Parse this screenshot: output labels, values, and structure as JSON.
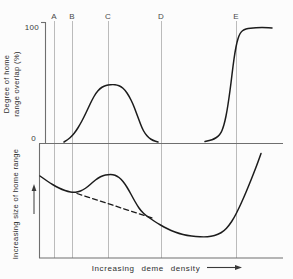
{
  "figure": {
    "background": "#fcfcfc",
    "colors": {
      "curve": "#1c1c1c",
      "axis": "#6f6f6f",
      "gridline": "#b3b3b3",
      "label": "#3a3a3a"
    },
    "top_panel": {
      "ylabel_line1": "Degree of home",
      "ylabel_line2": "range overlap (%)",
      "ytick_top": "100",
      "ytick_bottom": "0"
    },
    "bottom_panel": {
      "ylabel": "Increasing size of home range"
    },
    "xlabel": "Increasing  deme  density"
  },
  "chart_data": {
    "type": "line",
    "xlabel": "Increasing deme density",
    "x_markers": {
      "labels": [
        "A",
        "B",
        "C",
        "D",
        "E"
      ],
      "x_px": [
        54,
        72,
        108,
        161,
        236
      ],
      "label_baseline_y": 19,
      "line_y1": 21,
      "line_y2": 258
    },
    "panels": [
      {
        "name": "top",
        "ylabel": "Degree of home range overlap (%)",
        "ylim": [
          0,
          100
        ],
        "yticks": [
          0,
          100
        ],
        "marker_values_pct": {
          "A": 0,
          "B": 0,
          "C": 50,
          "D": 0,
          "E": 100
        },
        "series": [
          {
            "name": "overlap_bell",
            "desc": "unimodal flat-topped curve between B and D peaking at ~50% around C",
            "style": "solid",
            "points": [
              [
                64,
                142
              ],
              [
                68,
                139.5
              ],
              [
                72,
                136
              ],
              [
                76,
                131
              ],
              [
                80,
                124.5
              ],
              [
                84,
                117
              ],
              [
                88,
                108.5
              ],
              [
                92,
                100
              ],
              [
                96,
                93
              ],
              [
                100,
                88.5
              ],
              [
                104,
                86
              ],
              [
                108,
                85
              ],
              [
                113,
                84.5
              ],
              [
                117,
                85
              ],
              [
                121,
                86.5
              ],
              [
                125,
                90
              ],
              [
                129,
                96
              ],
              [
                133,
                104
              ],
              [
                136,
                112
              ],
              [
                139,
                120
              ],
              [
                142,
                128
              ],
              [
                145,
                133.5
              ],
              [
                149,
                138
              ],
              [
                153,
                140.5
              ],
              [
                158,
                142
              ]
            ]
          },
          {
            "name": "overlap_sigmoid",
            "desc": "sigmoidal rise from 0 to ~100% centered just before E",
            "style": "solid",
            "points": [
              [
                205,
                141.5
              ],
              [
                210,
                140.5
              ],
              [
                214,
                139
              ],
              [
                218,
                136.5
              ],
              [
                221,
                133
              ],
              [
                223,
                128
              ],
              [
                225,
                121
              ],
              [
                227,
                111
              ],
              [
                229,
                98
              ],
              [
                231,
                83
              ],
              [
                233,
                66
              ],
              [
                235,
                52
              ],
              [
                237,
                42
              ],
              [
                239,
                35.5
              ],
              [
                241,
                32
              ],
              [
                244,
                29.5
              ],
              [
                248,
                28.5
              ],
              [
                253,
                28
              ],
              [
                259,
                27.5
              ],
              [
                265,
                27.5
              ],
              [
                272,
                28
              ]
            ]
          }
        ]
      },
      {
        "name": "bottom",
        "ylabel": "Increasing size of home range (arrow up)",
        "series": [
          {
            "name": "home_range_size",
            "desc": "declines from left, local bump peaking near C, broad minimum between D and E, steep rise after E",
            "style": "solid",
            "points": [
              [
                40,
                176
              ],
              [
                45,
                179.5
              ],
              [
                50,
                183
              ],
              [
                56,
                186.5
              ],
              [
                62,
                189.5
              ],
              [
                68,
                191.5
              ],
              [
                73,
                192.5
              ],
              [
                78,
                192
              ],
              [
                83,
                190
              ],
              [
                88,
                186.5
              ],
              [
                93,
                182
              ],
              [
                98,
                178
              ],
              [
                103,
                175.5
              ],
              [
                108,
                174.5
              ],
              [
                113,
                174.5
              ],
              [
                117,
                176
              ],
              [
                121,
                179
              ],
              [
                125,
                184
              ],
              [
                129,
                190.5
              ],
              [
                133,
                198
              ],
              [
                137,
                205
              ],
              [
                141,
                211
              ],
              [
                146,
                215.5
              ],
              [
                151,
                219
              ],
              [
                157,
                223
              ],
              [
                164,
                227
              ],
              [
                171,
                230.5
              ],
              [
                179,
                233.5
              ],
              [
                187,
                235.5
              ],
              [
                196,
                236.5
              ],
              [
                204,
                237
              ],
              [
                211,
                236.5
              ],
              [
                218,
                234.5
              ],
              [
                224,
                231
              ],
              [
                229,
                225.5
              ],
              [
                234,
                218
              ],
              [
                239,
                208
              ],
              [
                244,
                197
              ],
              [
                249,
                185
              ],
              [
                254,
                172.5
              ],
              [
                258,
                162
              ],
              [
                261,
                153.5
              ]
            ]
          },
          {
            "name": "extrapolated_trend",
            "desc": "dashed straight continuation of the initial decline, rejoining solid curve right of D",
            "style": "dashed",
            "points": [
              [
                77,
                193.5
              ],
              [
                152,
                218
              ]
            ]
          }
        ]
      }
    ],
    "layout": {
      "width": 293,
      "height": 279,
      "top_y_axis": {
        "x": 45.5,
        "y1": 22,
        "y2": 143,
        "tick_x1": 41,
        "tick_y": 22.5
      },
      "zero_line": {
        "x1": 39,
        "x2": 283,
        "y": 143.5
      },
      "bottom_y_axis": {
        "x": 39.5,
        "y1": 143.5,
        "y2": 258
      },
      "bottom_x_axis": {
        "x1": 39,
        "x2": 283,
        "y": 258
      },
      "up_arrow": {
        "x": 34,
        "y1": 214,
        "y2": 189,
        "head_y": 184
      },
      "xlabel_arrow": {
        "x1": 207,
        "x2": 236,
        "y": 267.5,
        "head_x": 242
      }
    }
  }
}
